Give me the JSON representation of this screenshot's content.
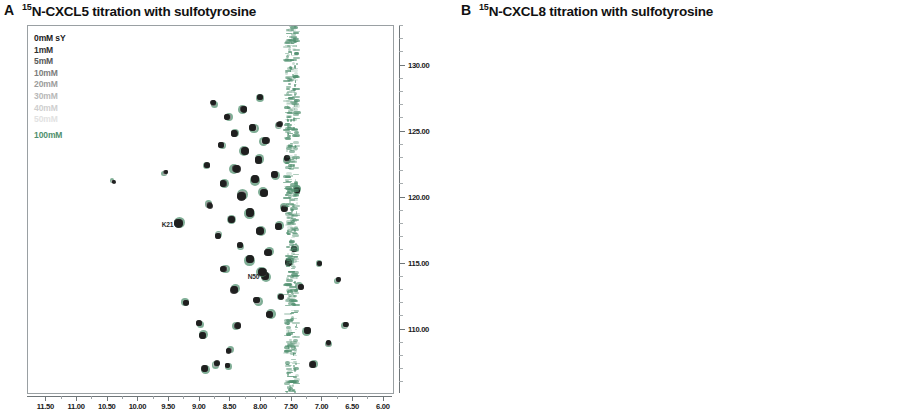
{
  "figure": {
    "panels": [
      {
        "letter": "A",
        "title_sup": "15",
        "title": "N-CXCL5 titration with sulfotyrosine",
        "accent_color": "#4f8f6e",
        "legend": [
          {
            "label": "0mM sY",
            "color": "#1a1a1a"
          },
          {
            "label": "1mM",
            "color": "#2f2f2f"
          },
          {
            "label": "5mM",
            "color": "#565656"
          },
          {
            "label": "10mM",
            "color": "#7d7d7d"
          },
          {
            "label": "20mM",
            "color": "#9c9c9c"
          },
          {
            "label": "30mM",
            "color": "#b8b8b8"
          },
          {
            "label": "40mM",
            "color": "#cfcfcf"
          },
          {
            "label": "50mM",
            "color": "#e2e2e2"
          },
          {
            "label": "",
            "color": "#ffffff"
          },
          {
            "label": "100mM",
            "color": "#4f8f6e"
          }
        ],
        "xaxis": {
          "label": "",
          "ticks": [
            "11.50",
            "11.00",
            "10.50",
            "10.00",
            "9.50",
            "9.00",
            "8.50",
            "8.00",
            "7.50",
            "7.00",
            "6.50",
            "6.00"
          ],
          "min": 5.85,
          "max": 11.8
        },
        "yaxis": {
          "label": "",
          "ticks": [
            "110.00",
            "115.00",
            "120.00",
            "125.00",
            "130.00"
          ],
          "min": 105.2,
          "max": 133.0
        },
        "peak_labels": [
          {
            "text": "K21",
            "x": 9.35,
            "y": 118.0
          },
          {
            "text": "N50",
            "x": 7.95,
            "y": 114.1
          }
        ]
      },
      {
        "letter": "B",
        "title_sup": "15",
        "title": "N-CXCL8 titration with sulfotyrosine",
        "accent_color": "#4db4ea",
        "legend": [
          {
            "label": "0mM sY",
            "color": "#1a1a1a"
          },
          {
            "label": "1mM",
            "color": "#2f2f2f"
          },
          {
            "label": "5mM",
            "color": "#565656"
          },
          {
            "label": "10mM",
            "color": "#7d7d7d"
          },
          {
            "label": "20mM",
            "color": "#9c9c9c"
          },
          {
            "label": "30mM",
            "color": "#b8b8b8"
          },
          {
            "label": "40mM",
            "color": "#cfcfcf"
          },
          {
            "label": "50mM",
            "color": "#e2e2e2"
          },
          {
            "label": "",
            "color": "#ffffff"
          },
          {
            "label": "100mM",
            "color": "#4db4ea"
          }
        ],
        "xaxis": {
          "label": "",
          "ticks": [
            "12.00",
            "11.50",
            "11.00",
            "10.50",
            "10.00",
            "9.50",
            "9.00",
            "8.50",
            "8.00",
            "7.50",
            "7.00",
            "6.50",
            "6.00",
            "5.50"
          ],
          "min": 5.35,
          "max": 12.3
        },
        "yaxis": {
          "label": "",
          "ticks": [
            "110.00",
            "115.00",
            "120.00",
            "125.00",
            "130.00"
          ],
          "min": 105.2,
          "max": 133.0
        },
        "peak_labels": [
          {
            "text": "G31",
            "x": 8.98,
            "y": 109.1
          },
          {
            "text": "T12",
            "x": 8.72,
            "y": 112.2
          },
          {
            "text": "E70",
            "x": 8.86,
            "y": 115.4
          },
          {
            "text": "K67",
            "x": 8.66,
            "y": 117.0
          },
          {
            "text": "R60",
            "x": 8.6,
            "y": 118.2
          },
          {
            "text": "C34",
            "x": 6.55,
            "y": 116.3
          },
          {
            "text": "W57",
            "x": 9.08,
            "y": 118.9
          },
          {
            "text": "V61",
            "x": 8.76,
            "y": 120.4
          },
          {
            "text": "V62",
            "x": 8.36,
            "y": 121.3
          },
          {
            "text": "F65",
            "x": 8.52,
            "y": 121.6
          },
          {
            "text": "R68",
            "x": 7.92,
            "y": 121.2
          },
          {
            "text": "H18",
            "x": 8.6,
            "y": 122.6
          },
          {
            "text": "L49",
            "x": 8.5,
            "y": 125.6
          },
          {
            "text": "K20",
            "x": 10.1,
            "y": 128.0
          },
          {
            "text": "V58",
            "x": 5.78,
            "y": 124.6
          }
        ]
      }
    ]
  },
  "chart_data": {
    "type": "scatter",
    "xlabel": "1H chemical shift (ppm)",
    "ylabel": "15N chemical shift (ppm)",
    "legend_position": "top-left inside plot",
    "grid": false,
    "panels": [
      {
        "name": "A",
        "series_name": "15N-CXCL5 titration with sulfotyrosine",
        "xlim": [
          11.8,
          5.85
        ],
        "ylim": [
          133.0,
          105.2
        ],
        "xticks": [
          11.5,
          11.0,
          10.5,
          10.0,
          9.5,
          9.0,
          8.5,
          8.0,
          7.5,
          7.0,
          6.5,
          6.0
        ],
        "yticks": [
          110.0,
          115.0,
          120.0,
          125.0,
          130.0
        ],
        "titration_points_mM": [
          0,
          1,
          5,
          10,
          20,
          30,
          40,
          50,
          100
        ],
        "final_point_color": "#4f8f6e",
        "annotations": [
          {
            "text": "K21",
            "x": 9.35,
            "y": 118.0
          },
          {
            "text": "N50",
            "x": 7.95,
            "y": 114.1
          }
        ],
        "peaks": [
          {
            "x": 9.35,
            "y": 118.05,
            "r": 4.4
          },
          {
            "x": 7.93,
            "y": 114.1,
            "r": 4.0
          },
          {
            "x": 8.92,
            "y": 107.05,
            "r": 3.4
          },
          {
            "x": 8.72,
            "y": 107.45,
            "r": 3.0
          },
          {
            "x": 8.55,
            "y": 107.3,
            "r": 2.6
          },
          {
            "x": 7.16,
            "y": 107.35,
            "r": 3.2
          },
          {
            "x": 8.53,
            "y": 108.4,
            "r": 2.8
          },
          {
            "x": 8.95,
            "y": 109.55,
            "r": 3.6
          },
          {
            "x": 7.24,
            "y": 109.95,
            "r": 3.4
          },
          {
            "x": 9.02,
            "y": 110.5,
            "r": 3.0
          },
          {
            "x": 8.38,
            "y": 110.3,
            "r": 3.2
          },
          {
            "x": 7.86,
            "y": 111.15,
            "r": 3.8
          },
          {
            "x": 9.22,
            "y": 112.05,
            "r": 3.0
          },
          {
            "x": 8.08,
            "y": 112.25,
            "r": 3.4
          },
          {
            "x": 7.68,
            "y": 112.5,
            "r": 3.0
          },
          {
            "x": 8.44,
            "y": 113.0,
            "r": 3.8
          },
          {
            "x": 7.35,
            "y": 113.25,
            "r": 3.2
          },
          {
            "x": 7.98,
            "y": 114.35,
            "r": 4.2
          },
          {
            "x": 8.62,
            "y": 114.6,
            "r": 3.4
          },
          {
            "x": 7.55,
            "y": 115.1,
            "r": 3.6
          },
          {
            "x": 8.18,
            "y": 115.35,
            "r": 4.2
          },
          {
            "x": 7.89,
            "y": 115.85,
            "r": 3.8
          },
          {
            "x": 8.34,
            "y": 116.4,
            "r": 3.0
          },
          {
            "x": 7.46,
            "y": 116.1,
            "r": 3.2
          },
          {
            "x": 8.7,
            "y": 117.1,
            "r": 3.0
          },
          {
            "x": 8.02,
            "y": 117.45,
            "r": 4.0
          },
          {
            "x": 7.72,
            "y": 117.8,
            "r": 3.4
          },
          {
            "x": 8.48,
            "y": 118.35,
            "r": 3.6
          },
          {
            "x": 8.18,
            "y": 118.9,
            "r": 4.4
          },
          {
            "x": 7.62,
            "y": 119.15,
            "r": 3.2
          },
          {
            "x": 8.84,
            "y": 119.4,
            "r": 3.0
          },
          {
            "x": 8.32,
            "y": 120.1,
            "r": 4.6
          },
          {
            "x": 7.95,
            "y": 120.35,
            "r": 4.0
          },
          {
            "x": 7.41,
            "y": 120.55,
            "r": 3.2
          },
          {
            "x": 8.62,
            "y": 121.05,
            "r": 3.4
          },
          {
            "x": 8.1,
            "y": 121.4,
            "r": 4.2
          },
          {
            "x": 7.78,
            "y": 121.75,
            "r": 3.6
          },
          {
            "x": 8.4,
            "y": 122.2,
            "r": 4.0
          },
          {
            "x": 8.88,
            "y": 122.45,
            "r": 2.8
          },
          {
            "x": 8.04,
            "y": 122.85,
            "r": 3.8
          },
          {
            "x": 7.58,
            "y": 123.0,
            "r": 3.2
          },
          {
            "x": 8.26,
            "y": 123.55,
            "r": 4.0
          },
          {
            "x": 8.66,
            "y": 124.0,
            "r": 3.0
          },
          {
            "x": 7.92,
            "y": 124.3,
            "r": 3.6
          },
          {
            "x": 8.44,
            "y": 124.85,
            "r": 3.4
          },
          {
            "x": 8.14,
            "y": 125.3,
            "r": 3.8
          },
          {
            "x": 7.7,
            "y": 125.55,
            "r": 3.0
          },
          {
            "x": 8.56,
            "y": 126.1,
            "r": 3.2
          },
          {
            "x": 8.28,
            "y": 126.7,
            "r": 3.4
          },
          {
            "x": 8.78,
            "y": 127.2,
            "r": 2.8
          },
          {
            "x": 8.02,
            "y": 127.6,
            "r": 3.0
          },
          {
            "x": 9.55,
            "y": 121.95,
            "r": 2.2
          },
          {
            "x": 10.4,
            "y": 121.2,
            "r": 1.8
          },
          {
            "x": 6.9,
            "y": 109.0,
            "r": 2.6
          },
          {
            "x": 6.62,
            "y": 110.4,
            "r": 2.8
          },
          {
            "x": 6.74,
            "y": 113.8,
            "r": 2.4
          },
          {
            "x": 7.05,
            "y": 115.0,
            "r": 2.6
          }
        ]
      },
      {
        "name": "B",
        "series_name": "15N-CXCL8 titration with sulfotyrosine",
        "xlim": [
          12.3,
          5.35
        ],
        "ylim": [
          133.0,
          105.2
        ],
        "xticks": [
          12.0,
          11.5,
          11.0,
          10.5,
          10.0,
          9.5,
          9.0,
          8.5,
          8.0,
          7.5,
          7.0,
          6.5,
          6.0,
          5.5
        ],
        "yticks": [
          110.0,
          115.0,
          120.0,
          125.0,
          130.0
        ],
        "titration_points_mM": [
          0,
          1,
          5,
          10,
          20,
          30,
          40,
          50,
          100
        ],
        "final_point_color": "#4db4ea",
        "annotations": [
          {
            "text": "G31",
            "x": 8.98,
            "y": 109.1
          },
          {
            "text": "T12",
            "x": 8.72,
            "y": 112.2
          },
          {
            "text": "E70",
            "x": 8.86,
            "y": 115.4
          },
          {
            "text": "K67",
            "x": 8.66,
            "y": 117.0
          },
          {
            "text": "R60",
            "x": 8.6,
            "y": 118.2
          },
          {
            "text": "C34",
            "x": 6.55,
            "y": 116.3
          },
          {
            "text": "W57",
            "x": 9.08,
            "y": 118.9
          },
          {
            "text": "V61",
            "x": 8.76,
            "y": 120.4
          },
          {
            "text": "V62",
            "x": 8.36,
            "y": 121.3
          },
          {
            "text": "F65",
            "x": 8.52,
            "y": 121.6
          },
          {
            "text": "R68",
            "x": 7.92,
            "y": 121.2
          },
          {
            "text": "H18",
            "x": 8.6,
            "y": 122.6
          },
          {
            "text": "L49",
            "x": 8.5,
            "y": 125.6
          },
          {
            "text": "K20",
            "x": 10.1,
            "y": 128.0
          },
          {
            "text": "V58",
            "x": 5.78,
            "y": 124.6
          }
        ],
        "peaks": [
          {
            "x": 8.86,
            "y": 109.15,
            "r": 4.0
          },
          {
            "x": 8.62,
            "y": 109.25,
            "r": 2.6
          },
          {
            "x": 8.6,
            "y": 112.25,
            "r": 4.4
          },
          {
            "x": 8.66,
            "y": 112.85,
            "r": 3.0
          },
          {
            "x": 8.44,
            "y": 112.95,
            "r": 3.2
          },
          {
            "x": 8.2,
            "y": 113.55,
            "r": 3.4
          },
          {
            "x": 8.22,
            "y": 114.55,
            "r": 3.8
          },
          {
            "x": 8.05,
            "y": 114.7,
            "r": 3.2
          },
          {
            "x": 8.32,
            "y": 115.25,
            "r": 3.0
          },
          {
            "x": 8.74,
            "y": 115.45,
            "r": 3.6
          },
          {
            "x": 8.52,
            "y": 117.05,
            "r": 3.8
          },
          {
            "x": 8.44,
            "y": 118.25,
            "r": 3.4
          },
          {
            "x": 6.42,
            "y": 116.4,
            "r": 3.4
          },
          {
            "x": 5.58,
            "y": 114.85,
            "r": 2.6
          },
          {
            "x": 8.96,
            "y": 119.0,
            "r": 3.6
          },
          {
            "x": 8.62,
            "y": 120.45,
            "r": 4.2
          },
          {
            "x": 8.48,
            "y": 120.7,
            "r": 3.2
          },
          {
            "x": 8.3,
            "y": 120.35,
            "r": 3.0
          },
          {
            "x": 8.14,
            "y": 120.5,
            "r": 3.4
          },
          {
            "x": 7.95,
            "y": 121.2,
            "r": 3.6
          },
          {
            "x": 8.3,
            "y": 121.45,
            "r": 3.8
          },
          {
            "x": 8.38,
            "y": 121.7,
            "r": 4.0
          },
          {
            "x": 8.12,
            "y": 122.15,
            "r": 3.6
          },
          {
            "x": 8.48,
            "y": 122.6,
            "r": 4.2
          },
          {
            "x": 8.3,
            "y": 122.95,
            "r": 3.4
          },
          {
            "x": 8.08,
            "y": 123.4,
            "r": 3.0
          },
          {
            "x": 8.22,
            "y": 123.85,
            "r": 3.6
          },
          {
            "x": 8.36,
            "y": 124.35,
            "r": 3.2
          },
          {
            "x": 8.4,
            "y": 125.7,
            "r": 3.8
          },
          {
            "x": 8.12,
            "y": 126.3,
            "r": 3.0
          },
          {
            "x": 8.6,
            "y": 126.85,
            "r": 2.8
          },
          {
            "x": 8.84,
            "y": 124.9,
            "r": 2.6
          },
          {
            "x": 9.0,
            "y": 122.1,
            "r": 2.8
          },
          {
            "x": 9.22,
            "y": 120.1,
            "r": 2.4
          },
          {
            "x": 9.38,
            "y": 124.6,
            "r": 2.4
          },
          {
            "x": 9.1,
            "y": 126.1,
            "r": 2.6
          },
          {
            "x": 9.52,
            "y": 126.55,
            "r": 2.4
          },
          {
            "x": 10.0,
            "y": 128.05,
            "r": 3.0
          },
          {
            "x": 10.28,
            "y": 128.1,
            "r": 2.4
          },
          {
            "x": 5.72,
            "y": 124.6,
            "r": 3.0
          },
          {
            "x": 7.72,
            "y": 121.0,
            "r": 3.4
          },
          {
            "x": 7.58,
            "y": 120.2,
            "r": 3.0
          },
          {
            "x": 7.8,
            "y": 123.25,
            "r": 3.0
          },
          {
            "x": 7.66,
            "y": 125.7,
            "r": 2.8
          },
          {
            "x": 6.95,
            "y": 110.2,
            "r": 2.6
          },
          {
            "x": 6.7,
            "y": 111.9,
            "r": 2.4
          },
          {
            "x": 6.3,
            "y": 109.3,
            "r": 2.4
          },
          {
            "x": 6.05,
            "y": 114.55,
            "r": 2.6
          },
          {
            "x": 6.88,
            "y": 118.6,
            "r": 2.6
          },
          {
            "x": 6.55,
            "y": 121.0,
            "r": 2.4
          },
          {
            "x": 11.05,
            "y": 131.1,
            "r": 1.8
          }
        ]
      }
    ]
  }
}
